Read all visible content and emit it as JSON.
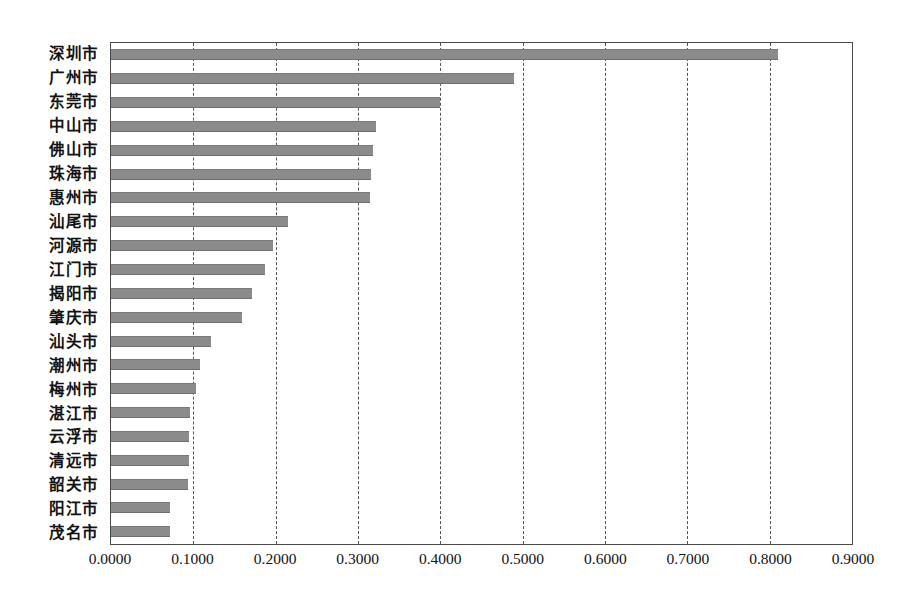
{
  "chart_data": {
    "type": "bar",
    "orientation": "horizontal",
    "title": "",
    "xlabel": "",
    "ylabel": "",
    "grid": true,
    "legend": false,
    "xlim": [
      0.0,
      0.9
    ],
    "xticks": [
      "0.0000",
      "0.1000",
      "0.2000",
      "0.3000",
      "0.4000",
      "0.5000",
      "0.6000",
      "0.7000",
      "0.8000",
      "0.9000"
    ],
    "xtick_values": [
      0.0,
      0.1,
      0.2,
      0.3,
      0.4,
      0.5,
      0.6,
      0.7,
      0.8,
      0.9
    ],
    "categories": [
      "深圳市",
      "广州市",
      "东莞市",
      "中山市",
      "佛山市",
      "珠海市",
      "惠州市",
      "汕尾市",
      "河源市",
      "江门市",
      "揭阳市",
      "肇庆市",
      "汕头市",
      "潮州市",
      "梅州市",
      "湛江市",
      "云浮市",
      "清远市",
      "韶关市",
      "阳江市",
      "茂名市"
    ],
    "values": [
      0.81,
      0.49,
      0.4,
      0.322,
      0.318,
      0.316,
      0.314,
      0.215,
      0.197,
      0.187,
      0.171,
      0.159,
      0.122,
      0.108,
      0.103,
      0.096,
      0.095,
      0.0945,
      0.094,
      0.072,
      0.0715
    ],
    "bar_color": "#8b8b8b",
    "axis_color": "#4a4a4a",
    "gridline_color": "#555555",
    "background": "#ffffff"
  }
}
